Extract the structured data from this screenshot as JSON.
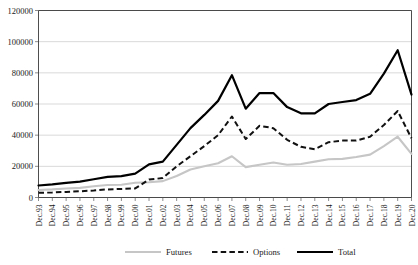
{
  "chart_data": {
    "type": "line",
    "title": "",
    "xlabel": "",
    "ylabel": "",
    "ylim": [
      0,
      120000
    ],
    "grid": true,
    "legend_position": "bottom",
    "categories": [
      "Dec.93",
      "Dec.94",
      "Dec.95",
      "Dec.96",
      "Dec.97",
      "Dec.98",
      "Dec.99",
      "Dec.00",
      "Dec.01",
      "Dec.02",
      "Dec.03",
      "Dec.04",
      "Dec.05",
      "Dec.06",
      "Dec.07",
      "Dec.08",
      "Dec.09",
      "Dec.10",
      "Dec.11",
      "Dec.12",
      "Dec.13",
      "Dec.14",
      "Dec.15",
      "Dec.16",
      "Dec.17",
      "Dec.18",
      "Dec.19",
      "Dec.20"
    ],
    "ytick_labels": [
      "0",
      "20000",
      "40000",
      "60000",
      "80000",
      "100000",
      "120000"
    ],
    "ytick_values": [
      0,
      20000,
      40000,
      60000,
      80000,
      100000,
      120000
    ],
    "series": [
      {
        "name": "Futures",
        "color": "#c6c6c6",
        "style": "solid",
        "values": [
          4800,
          5200,
          5800,
          6200,
          7200,
          8000,
          8200,
          9500,
          9800,
          10500,
          13800,
          18000,
          20000,
          22000,
          26500,
          19500,
          21000,
          22500,
          21000,
          21500,
          23000,
          24500,
          24800,
          26000,
          27500,
          33000,
          39000,
          28000
        ]
      },
      {
        "name": "Options",
        "color": "#111111",
        "style": "dashed",
        "values": [
          3000,
          3200,
          3600,
          4000,
          4500,
          5200,
          5500,
          5800,
          11500,
          12500,
          20000,
          26500,
          33000,
          40000,
          52000,
          37500,
          46000,
          44500,
          37000,
          32500,
          31000,
          35500,
          36500,
          36500,
          39000,
          46500,
          55500,
          38000
        ]
      },
      {
        "name": "Total",
        "color": "#000000",
        "style": "solid",
        "values": [
          7700,
          8400,
          9400,
          10200,
          11700,
          13200,
          13700,
          15300,
          21300,
          23000,
          33800,
          44500,
          53000,
          62000,
          78500,
          57000,
          67000,
          67000,
          58000,
          54000,
          54000,
          60000,
          61300,
          62500,
          66500,
          79500,
          94500,
          66000
        ]
      }
    ]
  },
  "legend": {
    "items": [
      {
        "label": "Futures"
      },
      {
        "label": "Options"
      },
      {
        "label": "Total"
      }
    ]
  }
}
